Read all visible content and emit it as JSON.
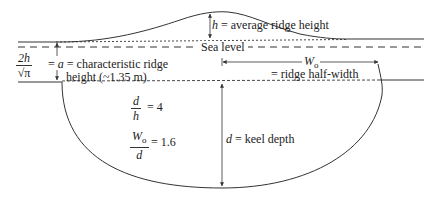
{
  "diagram": {
    "labels": {
      "sea_level": "Sea level",
      "avg_ridge_height_sym": "h",
      "avg_ridge_height_text": "= average ridge height",
      "char_height_num": "2h",
      "char_height_den": "√π",
      "char_height_eq": "=",
      "char_height_sym": "a",
      "char_height_text": "= characteristic ridge",
      "char_height_text2": "height (~1.35 m)",
      "half_width_sym": "W",
      "half_width_sub": "o",
      "half_width_text": "= ridge half-width",
      "keel_depth_sym": "d",
      "keel_depth_text": "= keel depth"
    },
    "ratios": [
      {
        "num": "d",
        "den": "h",
        "value": "= 4"
      },
      {
        "num": "W",
        "num_sub": "o",
        "den": "d",
        "value": "= 1.6"
      }
    ],
    "colors": {
      "line": "#333333",
      "background": "#ffffff"
    }
  }
}
